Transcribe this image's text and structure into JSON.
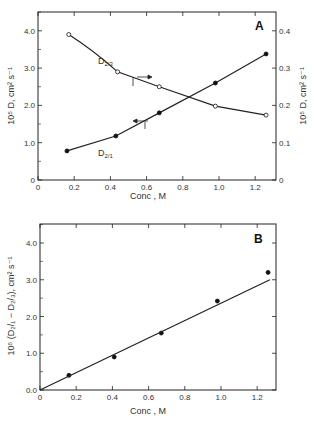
{
  "chart_data": [
    {
      "type": "line",
      "panel": "A",
      "xlabel": "Conc , M",
      "ylabel": "10⁵ D, cm² s⁻¹",
      "ylabel_right": "10⁵ D, cm² s⁻¹",
      "xlim": [
        0,
        1.33
      ],
      "ylim": [
        0,
        4.4
      ],
      "ylim_right": [
        0,
        0.44
      ],
      "x_ticks": [
        "0",
        "0.2",
        "0.4",
        "0.6",
        "0.8",
        "1.0",
        "1.2"
      ],
      "y_ticks": [
        "0",
        "1.0",
        "2.0",
        "3.0",
        "4.0"
      ],
      "y_ticks_right": [
        "0",
        "0.1",
        "0.2",
        "0.3",
        "0.4"
      ],
      "grid": false,
      "series": [
        {
          "name": "D2/3",
          "label": "D",
          "sub": "2/3",
          "marker": "open-circle",
          "axis": "left-and-right",
          "x": [
            0.17,
            0.44,
            0.67,
            0.98,
            1.26
          ],
          "y": [
            3.9,
            2.9,
            2.5,
            1.98,
            1.74
          ]
        },
        {
          "name": "D2/1",
          "label": "D",
          "sub": "2/1",
          "marker": "filled-circle",
          "axis": "left-and-right",
          "x": [
            0.16,
            0.43,
            0.67,
            0.98,
            1.26
          ],
          "y": [
            0.78,
            1.18,
            1.8,
            2.6,
            3.38
          ]
        }
      ],
      "annotations": [
        "arrow pointing right on D2/3 curve",
        "arrow pointing left on D2/1 curve"
      ]
    },
    {
      "type": "scatter",
      "panel": "B",
      "xlabel": "Conc , M",
      "ylabel": "10⁵ (D2/1 - D2/3), cm² s⁻¹",
      "xlim": [
        0,
        1.33
      ],
      "ylim": [
        0,
        4.4
      ],
      "x_ticks": [
        "0",
        "0.2",
        "0.4",
        "0.6",
        "0.8",
        "1.0",
        "1.2"
      ],
      "y_ticks": [
        "0.0",
        "1.0",
        "2.0",
        "3.0",
        "4.0"
      ],
      "grid": false,
      "series": [
        {
          "name": "D2/1 - D2/3",
          "marker": "filled-circle",
          "x": [
            0.16,
            0.41,
            0.67,
            0.98,
            1.26
          ],
          "y": [
            0.4,
            0.9,
            1.55,
            2.42,
            3.2
          ]
        }
      ],
      "fit_line": {
        "x": [
          0,
          1.27
        ],
        "y": [
          0,
          3.0
        ]
      }
    }
  ],
  "labels": {
    "panel_a": "A",
    "panel_b": "B",
    "xlabel": "Conc , M",
    "d23": "D",
    "d23_sub": "2/3",
    "d21": "D",
    "d21_sub": "2/1",
    "ylabel_a": "10⁵ D, cm² s⁻¹",
    "ylabel_a_right": "10⁵ D, cm² s⁻¹",
    "ylabel_b": "10⁵ (D₂/₁ − D₂/₃), cm² s⁻¹"
  }
}
